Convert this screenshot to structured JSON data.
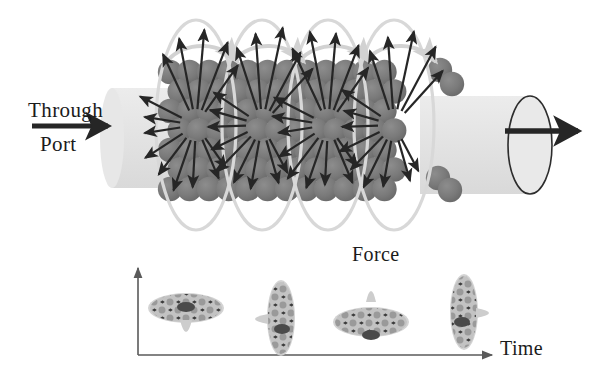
{
  "figure": {
    "background": "#ffffff"
  },
  "labels": {
    "through": "Through",
    "port": "Port",
    "force": "Force",
    "time": "Time"
  },
  "colors": {
    "sphere": "#7a7a7a",
    "sphere_edge": "#6d6d6d",
    "cylinder": "#e2e2e2",
    "loop_ring": "#d8d8d8",
    "arrow_dark": "#262626",
    "arrow_light": "#d2d2d2",
    "axis": "#5a5a5a",
    "text": "#1b1b1b"
  },
  "chart_data": {
    "type": "scatter",
    "title": "",
    "xlabel": "Time",
    "ylabel": "",
    "grid": false,
    "legend": null,
    "x": [
      1,
      2,
      3,
      4
    ],
    "categories": [
      "t1",
      "t2",
      "t3",
      "t4"
    ],
    "series": [
      {
        "name": "particle orientation",
        "values": [
          "horizontal",
          "vertical",
          "horizontal",
          "vertical"
        ]
      }
    ],
    "annotations": [
      "Force",
      "Time"
    ]
  },
  "main_diagram": {
    "inlet_label": "Through Port",
    "inlet_arrow": "right-arrow",
    "outlet_arrow": "right-arrow",
    "cross_section_count": 4,
    "force_vector_label": "Force",
    "sphere_columns": 12,
    "sphere_rows": 7
  },
  "timeline": {
    "axis_x_label": "Time",
    "item_count": 4,
    "orientations": [
      "wide",
      "tall",
      "wide",
      "tall"
    ]
  }
}
